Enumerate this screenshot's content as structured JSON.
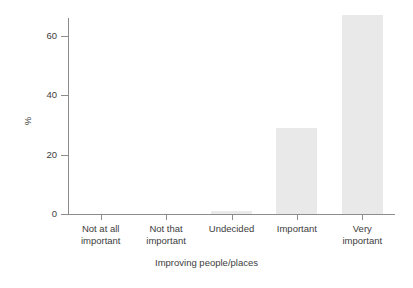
{
  "chart_data": {
    "type": "bar",
    "title": "",
    "subtitle": "",
    "xlabel": "Improving people/places",
    "ylabel": "%",
    "categories": [
      "Not at all\nimportant",
      "Not that\nimportant",
      "Undecided",
      "Important",
      "Very\nimportant"
    ],
    "values": [
      0,
      0,
      1,
      29,
      67
    ],
    "ylim": [
      0,
      70
    ],
    "yticks": [
      0,
      20,
      40,
      60
    ],
    "ytick_labels": [
      "0",
      "20",
      "40",
      "60"
    ],
    "grid": false,
    "legend": false,
    "legend_position": "none",
    "bar_color": "#e9e9e9",
    "axis_color": "#8c8c8c",
    "text_color": "#3d3d3d",
    "background": "#ffffff"
  },
  "axes": {
    "y_title": "%",
    "x_title": "Improving people/places"
  },
  "ticks": {
    "y": [
      {
        "label": "60",
        "value": 60
      },
      {
        "label": "40",
        "value": 40
      },
      {
        "label": "20",
        "value": 20
      },
      {
        "label": "0",
        "value": 0
      }
    ]
  },
  "bars": [
    {
      "label": "Not at all\nimportant",
      "value": 0
    },
    {
      "label": "Not that\nimportant",
      "value": 0
    },
    {
      "label": "Undecided",
      "value": 1
    },
    {
      "label": "Important",
      "value": 29
    },
    {
      "label": "Very\nimportant",
      "value": 67
    }
  ]
}
